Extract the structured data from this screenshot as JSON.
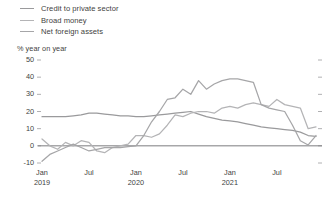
{
  "legend": {
    "position": "top-left",
    "items": [
      {
        "label": "Credit to private sector",
        "color": "#9a9a9c",
        "swatch_name": "legend-swatch-credit"
      },
      {
        "label": "Broad money",
        "color": "#b4b4b6",
        "swatch_name": "legend-swatch-broad-money"
      },
      {
        "label": "Net foreign assets",
        "color": "#a6a6a8",
        "swatch_name": "legend-swatch-nfa"
      }
    ]
  },
  "axis_title": "% year on year",
  "chart_data": {
    "type": "line",
    "title": "",
    "subtitle": "",
    "xlabel": "",
    "ylabel": "% year on year",
    "ylim": [
      -10,
      50
    ],
    "yticks": [
      50,
      40,
      30,
      20,
      10,
      0,
      -10
    ],
    "ytick_labels": [
      "50",
      "40",
      "30",
      "20",
      "10",
      "0",
      "-10"
    ],
    "grid": false,
    "zero_line": 0,
    "x": [
      "Jan 2019",
      "Feb 2019",
      "Mar 2019",
      "Apr 2019",
      "May 2019",
      "Jun 2019",
      "Jul 2019",
      "Aug 2019",
      "Sep 2019",
      "Oct 2019",
      "Nov 2019",
      "Dec 2019",
      "Jan 2020",
      "Feb 2020",
      "Mar 2020",
      "Apr 2020",
      "May 2020",
      "Jun 2020",
      "Jul 2020",
      "Aug 2020",
      "Sep 2020",
      "Oct 2020",
      "Nov 2020",
      "Dec 2020",
      "Jan 2021",
      "Feb 2021",
      "Mar 2021",
      "Apr 2021",
      "May 2021",
      "Jun 2021",
      "Jul 2021",
      "Aug 2021",
      "Sep 2021",
      "Oct 2021",
      "Nov 2021",
      "Dec 2021"
    ],
    "xticks": [
      {
        "index": 0,
        "label": "Jan",
        "sublabel": "2019"
      },
      {
        "index": 6,
        "label": "Jul",
        "sublabel": ""
      },
      {
        "index": 12,
        "label": "Jan",
        "sublabel": "2020"
      },
      {
        "index": 18,
        "label": "Jul",
        "sublabel": ""
      },
      {
        "index": 24,
        "label": "Jan",
        "sublabel": "2021"
      },
      {
        "index": 30,
        "label": "Jul",
        "sublabel": ""
      }
    ],
    "series": [
      {
        "name": "Credit to private sector",
        "color": "#9a9a9c",
        "values": [
          17,
          17,
          17,
          17,
          17.5,
          18,
          19,
          19,
          18.5,
          18,
          17.5,
          17.5,
          17,
          17,
          17.5,
          18,
          18.5,
          19,
          19.5,
          20,
          18.5,
          17,
          16,
          15,
          14.5,
          14,
          13,
          12,
          11,
          10.5,
          10,
          9.5,
          9,
          8,
          6,
          5.5
        ]
      },
      {
        "name": "Broad money",
        "color": "#b4b4b6",
        "values": [
          4,
          0,
          -2,
          2,
          0,
          3,
          2,
          -3,
          -4,
          -1,
          0,
          1,
          6,
          6,
          5,
          7,
          12,
          18,
          17,
          19,
          20,
          20,
          19,
          22,
          23,
          22,
          24,
          25,
          24,
          23,
          27,
          24,
          23,
          22,
          10,
          11
        ]
      },
      {
        "name": "Net foreign assets",
        "color": "#a6a6a8",
        "values": [
          -9,
          -5,
          -3,
          -1,
          1,
          -1,
          -3,
          -2,
          -1,
          -1,
          -1,
          -0.5,
          0,
          6,
          14,
          20,
          27,
          28,
          33,
          30,
          38,
          33,
          36,
          38,
          39,
          39,
          38,
          37,
          24,
          22,
          21,
          20,
          12,
          3,
          0.5,
          6
        ]
      }
    ]
  }
}
